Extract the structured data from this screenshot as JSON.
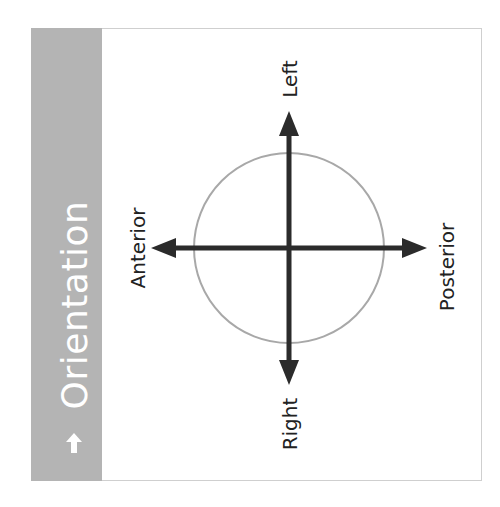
{
  "sidebar": {
    "title": "Orientation",
    "icon": "arrow-up-icon",
    "background": "#b4b4b4",
    "text_color": "#ffffff"
  },
  "diagram": {
    "labels": {
      "top": "Left",
      "bottom": "Right",
      "left": "Anterior",
      "right": "Posterior"
    },
    "circle_color": "#a8a8a8",
    "axis_color": "#2b2b2b"
  }
}
